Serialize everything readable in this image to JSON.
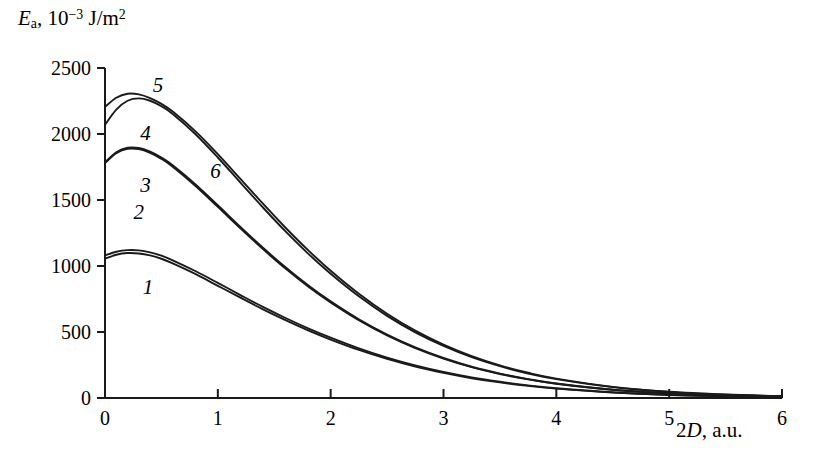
{
  "chart_data": {
    "type": "line",
    "title": "",
    "xlabel": "2D, a.u.",
    "ylabel": "Ea, 10^-3 J/m^2",
    "xlim": [
      0,
      6
    ],
    "ylim": [
      0,
      2500
    ],
    "grid": false,
    "legend": "inline-curve-numbers",
    "x_ticks": [
      "0",
      "1",
      "2",
      "3",
      "4",
      "5",
      "6"
    ],
    "y_ticks": [
      "0",
      "500",
      "1000",
      "1500",
      "2000",
      "2500"
    ],
    "x_tick_values": [
      0,
      1,
      2,
      3,
      4,
      5,
      6
    ],
    "y_tick_values": [
      0,
      500,
      1000,
      1500,
      2000,
      2500
    ],
    "x": [
      0,
      0.1,
      0.2,
      0.3,
      0.4,
      0.5,
      0.6,
      0.8,
      1.0,
      1.2,
      1.4,
      1.6,
      1.8,
      2.0,
      2.25,
      2.5,
      2.75,
      3.0,
      3.25,
      3.5,
      3.75,
      4.0,
      4.5,
      5.0,
      5.5,
      6.0
    ],
    "series": [
      {
        "name": "1",
        "label": "1",
        "color": "#1a1a1a",
        "values": [
          1055,
          1085,
          1098,
          1095,
          1080,
          1055,
          1020,
          940,
          850,
          760,
          672,
          590,
          513,
          443,
          364,
          296,
          238,
          190,
          150,
          118,
          92,
          71,
          41,
          23,
          12,
          6
        ]
      },
      {
        "name": "2",
        "label": "2",
        "color": "#1a1a1a",
        "values": [
          1080,
          1108,
          1120,
          1118,
          1103,
          1078,
          1043,
          962,
          872,
          780,
          690,
          606,
          528,
          457,
          376,
          306,
          247,
          197,
          156,
          123,
          96,
          74,
          43,
          24,
          13,
          6
        ]
      },
      {
        "name": "3",
        "label": "3",
        "color": "#1a1a1a",
        "values": [
          1780,
          1855,
          1888,
          1885,
          1857,
          1812,
          1752,
          1608,
          1448,
          1285,
          1128,
          980,
          845,
          724,
          589,
          474,
          378,
          299,
          234,
          182,
          141,
          108,
          62,
          35,
          19,
          9
        ]
      },
      {
        "name": "4",
        "label": "4",
        "color": "#1a1a1a",
        "values": [
          2070,
          2185,
          2252,
          2270,
          2252,
          2210,
          2152,
          2000,
          1822,
          1632,
          1443,
          1262,
          1094,
          941,
          770,
          622,
          497,
          394,
          309,
          241,
          186,
          143,
          82,
          46,
          25,
          13
        ]
      },
      {
        "name": "5",
        "label": "5",
        "color": "#1a1a1a",
        "values": [
          2205,
          2275,
          2305,
          2300,
          2272,
          2228,
          2170,
          2022,
          1848,
          1660,
          1472,
          1290,
          1120,
          964,
          790,
          638,
          510,
          404,
          317,
          247,
          191,
          147,
          84,
          47,
          26,
          13
        ]
      },
      {
        "name": "6",
        "label": "6",
        "color": "#1a1a1a",
        "values": [
          1785,
          1862,
          1896,
          1894,
          1866,
          1822,
          1763,
          1620,
          1460,
          1296,
          1138,
          990,
          854,
          732,
          596,
          480,
          383,
          303,
          237,
          185,
          143,
          110,
          63,
          36,
          19,
          9
        ]
      }
    ],
    "curve_label_positions": [
      {
        "label": "1",
        "x": 0.38,
        "y": 840
      },
      {
        "label": "2",
        "x": 0.3,
        "y": 1410
      },
      {
        "label": "3",
        "x": 0.36,
        "y": 1610
      },
      {
        "label": "4",
        "x": 0.36,
        "y": 2010
      },
      {
        "label": "5",
        "x": 0.47,
        "y": 2370
      },
      {
        "label": "6",
        "x": 0.98,
        "y": 1720
      }
    ]
  },
  "axis": {
    "y_title_parts": {
      "symbol": "E",
      "subscript": "a",
      "comma": ", 10",
      "exponent": "−3",
      "units": " J/m",
      "units_exponent": "2"
    },
    "x_title_parts": {
      "prefix": "2",
      "symbol": "D",
      "suffix": ", a.u."
    }
  }
}
